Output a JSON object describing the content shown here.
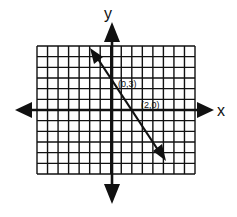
{
  "chart_data": {
    "type": "line",
    "title": "",
    "xlabel": "x",
    "ylabel": "y",
    "grid": true,
    "grid_columns": 15,
    "grid_rows": 12,
    "xlim": [
      -7,
      8
    ],
    "ylim": [
      -6,
      6
    ],
    "series": [
      {
        "name": "line through (0,3) and (2,0)",
        "points": [
          {
            "x": -2,
            "y": 6
          },
          {
            "x": 0,
            "y": 3
          },
          {
            "x": 2,
            "y": 0
          },
          {
            "x": 5,
            "y": -4.5
          }
        ],
        "slope": -1.5,
        "intercept": 3
      }
    ],
    "annotations": [
      {
        "text": "(0,3)",
        "x": 0,
        "y": 3
      },
      {
        "text": "(2,0)",
        "x": 2,
        "y": 0
      }
    ]
  },
  "labels": {
    "x_axis": "x",
    "y_axis": "y",
    "point_a": "(0,3)",
    "point_b": "(2,0)"
  },
  "colors": {
    "ink": "#111111",
    "background": "#ffffff"
  }
}
